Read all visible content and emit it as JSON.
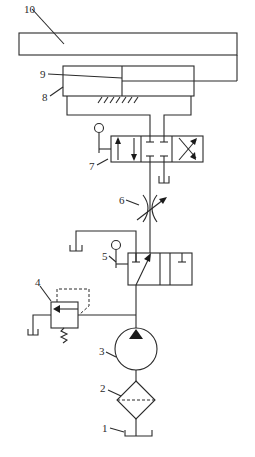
{
  "diagram": {
    "type": "hydraulic-circuit",
    "line_color": "#2a2a2a",
    "labels": [
      {
        "id": "1",
        "text": "1",
        "component": "oil-tank"
      },
      {
        "id": "2",
        "text": "2",
        "component": "filter"
      },
      {
        "id": "3",
        "text": "3",
        "component": "hydraulic-pump"
      },
      {
        "id": "4",
        "text": "4",
        "component": "relief-valve"
      },
      {
        "id": "5",
        "text": "5",
        "component": "two-position-directional-valve"
      },
      {
        "id": "6",
        "text": "6",
        "component": "throttle-valve"
      },
      {
        "id": "7",
        "text": "7",
        "component": "three-position-directional-valve"
      },
      {
        "id": "8",
        "text": "8",
        "component": "hydraulic-cylinder"
      },
      {
        "id": "9",
        "text": "9",
        "component": "piston"
      },
      {
        "id": "10",
        "text": "10",
        "component": "worktable"
      }
    ]
  }
}
